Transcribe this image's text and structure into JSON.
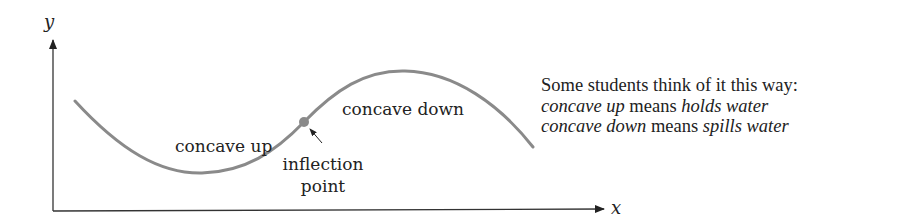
{
  "diagram": {
    "axes": {
      "x_label": "x",
      "y_label": "y"
    },
    "curve": {
      "color": "#8a8a8a",
      "description": "S-shaped curve: concave up region then concave down region"
    },
    "labels": {
      "concave_up": "concave up",
      "concave_down": "concave down",
      "inflection_line1": "inflection",
      "inflection_line2": "point"
    },
    "inflection_point": {
      "color": "#8a8a8a"
    },
    "note": {
      "line1": "Some students think of it this way:",
      "line2": {
        "term": "concave up",
        "mid": " means ",
        "meaning": "holds water"
      },
      "line3": {
        "term": "concave down",
        "mid": " means ",
        "meaning": "spills water"
      }
    }
  }
}
